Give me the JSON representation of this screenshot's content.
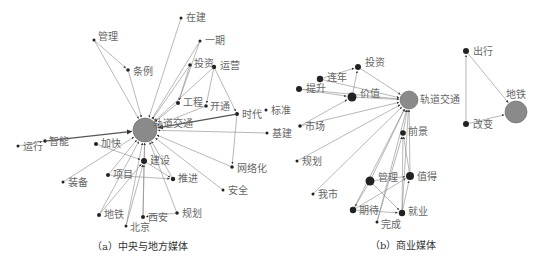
{
  "panels": [
    {
      "id": "a",
      "caption": "（a）中央与地方媒体",
      "hub": {
        "label": "轨道交通",
        "x": 145,
        "y": 130,
        "r": 12
      },
      "nodes": [
        {
          "label": "在建",
          "x": 181,
          "y": 18,
          "r": 1.5,
          "lx": 186,
          "ly": 21
        },
        {
          "label": "管理",
          "x": 94,
          "y": 40,
          "r": 1.5,
          "lx": 98,
          "ly": 40
        },
        {
          "label": "一期",
          "x": 200,
          "y": 41,
          "r": 1.5,
          "lx": 205,
          "ly": 44
        },
        {
          "label": "条例",
          "x": 128,
          "y": 70,
          "r": 1.8,
          "lx": 133,
          "ly": 75
        },
        {
          "label": "投资",
          "x": 190,
          "y": 65,
          "r": 1.8,
          "lx": 194,
          "ly": 67
        },
        {
          "label": "运营",
          "x": 214,
          "y": 67,
          "r": 2.2,
          "lx": 220,
          "ly": 69
        },
        {
          "label": "工程",
          "x": 178,
          "y": 103,
          "r": 2,
          "lx": 183,
          "ly": 106
        },
        {
          "label": "开通",
          "x": 206,
          "y": 106,
          "r": 1.8,
          "lx": 210,
          "ly": 110
        },
        {
          "label": "时代",
          "x": 237,
          "y": 114,
          "r": 2,
          "lx": 242,
          "ly": 118
        },
        {
          "label": "标准",
          "x": 266,
          "y": 110,
          "r": 1.5,
          "lx": 271,
          "ly": 114
        },
        {
          "label": "基建",
          "x": 267,
          "y": 133,
          "r": 1.5,
          "lx": 272,
          "ly": 137
        },
        {
          "label": "智能",
          "x": 45,
          "y": 141,
          "r": 1.8,
          "lx": 49,
          "ly": 145
        },
        {
          "label": "运行",
          "x": 18,
          "y": 146,
          "r": 1.5,
          "lx": 23,
          "ly": 150
        },
        {
          "label": "加快",
          "x": 96,
          "y": 144,
          "r": 2,
          "lx": 101,
          "ly": 147
        },
        {
          "label": "建设",
          "x": 144,
          "y": 161,
          "r": 3,
          "lx": 150,
          "ly": 164
        },
        {
          "label": "网络化",
          "x": 232,
          "y": 167,
          "r": 1.8,
          "lx": 237,
          "ly": 172
        },
        {
          "label": "项目",
          "x": 108,
          "y": 175,
          "r": 2,
          "lx": 113,
          "ly": 178
        },
        {
          "label": "推进",
          "x": 173,
          "y": 179,
          "r": 2.2,
          "lx": 178,
          "ly": 182
        },
        {
          "label": "装备",
          "x": 63,
          "y": 182,
          "r": 1.5,
          "lx": 68,
          "ly": 186
        },
        {
          "label": "安全",
          "x": 223,
          "y": 190,
          "r": 1.5,
          "lx": 228,
          "ly": 194
        },
        {
          "label": "地铁",
          "x": 99,
          "y": 215,
          "r": 2,
          "lx": 104,
          "ly": 218
        },
        {
          "label": "西安",
          "x": 143,
          "y": 217,
          "r": 2,
          "lx": 148,
          "ly": 221
        },
        {
          "label": "规划",
          "x": 177,
          "y": 213,
          "r": 1.8,
          "lx": 182,
          "ly": 217
        },
        {
          "label": "北京",
          "x": 126,
          "y": 226,
          "r": 1.5,
          "lx": 130,
          "ly": 231
        }
      ],
      "edges": [
        [
          "在建",
          "hub"
        ],
        [
          "管理",
          "hub"
        ],
        [
          "管理",
          "条例"
        ],
        [
          "一期",
          "hub"
        ],
        [
          "一期",
          "工程"
        ],
        [
          "条例",
          "hub"
        ],
        [
          "投资",
          "hub"
        ],
        [
          "投资",
          "工程"
        ],
        [
          "运营",
          "hub"
        ],
        [
          "运营",
          "开通"
        ],
        [
          "运营",
          "时代"
        ],
        [
          "工程",
          "hub"
        ],
        [
          "开通",
          "hub"
        ],
        [
          "时代",
          "hub",
          "thick"
        ],
        [
          "时代",
          "网络化"
        ],
        [
          "基建",
          "hub"
        ],
        [
          "智能",
          "hub",
          "thick"
        ],
        [
          "运行",
          "智能"
        ],
        [
          "加快",
          "建设"
        ],
        [
          "建设",
          "hub"
        ],
        [
          "建设",
          "推进"
        ],
        [
          "网络化",
          "hub"
        ],
        [
          "项目",
          "hub"
        ],
        [
          "项目",
          "推进"
        ],
        [
          "推进",
          "hub"
        ],
        [
          "装备",
          "hub"
        ],
        [
          "安全",
          "hub"
        ],
        [
          "地铁",
          "hub"
        ],
        [
          "地铁",
          "建设"
        ],
        [
          "西安",
          "hub"
        ],
        [
          "西安",
          "建设"
        ],
        [
          "规划",
          "hub"
        ],
        [
          "规划",
          "西安"
        ],
        [
          "北京",
          "hub"
        ],
        [
          "北京",
          "建设"
        ]
      ]
    },
    {
      "id": "b1",
      "caption": "（b）商业媒体",
      "hub": {
        "label": "轨道交通",
        "x": 409,
        "y": 100,
        "r": 9
      },
      "nodes": [
        {
          "label": "投资",
          "x": 358,
          "y": 67,
          "r": 3,
          "lx": 365,
          "ly": 66
        },
        {
          "label": "连年",
          "x": 320,
          "y": 79,
          "r": 3.2,
          "lx": 327,
          "ly": 81
        },
        {
          "label": "提升",
          "x": 299,
          "y": 89,
          "r": 3,
          "lx": 306,
          "ly": 92
        },
        {
          "label": "价值",
          "x": 352,
          "y": 97,
          "r": 4.5,
          "lx": 360,
          "ly": 97
        },
        {
          "label": "市场",
          "x": 300,
          "y": 126,
          "r": 1.8,
          "lx": 305,
          "ly": 130
        },
        {
          "label": "前景",
          "x": 403,
          "y": 133,
          "r": 2.8,
          "lx": 408,
          "ly": 135
        },
        {
          "label": "规划",
          "x": 297,
          "y": 161,
          "r": 1.5,
          "lx": 302,
          "ly": 165
        },
        {
          "label": "值得",
          "x": 410,
          "y": 176,
          "r": 4,
          "lx": 417,
          "ly": 180
        },
        {
          "label": "管理",
          "x": 370,
          "y": 181,
          "r": 4.5,
          "lx": 378,
          "ly": 181
        },
        {
          "label": "我市",
          "x": 313,
          "y": 194,
          "r": 1.5,
          "lx": 318,
          "ly": 198
        },
        {
          "label": "期待",
          "x": 353,
          "y": 210,
          "r": 3.2,
          "lx": 359,
          "ly": 214
        },
        {
          "label": "就业",
          "x": 402,
          "y": 213,
          "r": 3.2,
          "lx": 408,
          "ly": 215
        },
        {
          "label": "完成",
          "x": 377,
          "y": 222,
          "r": 1.5,
          "lx": 381,
          "ly": 228
        }
      ],
      "edges": [
        [
          "投资",
          "hub"
        ],
        [
          "连年",
          "投资"
        ],
        [
          "连年",
          "hub"
        ],
        [
          "提升",
          "hub"
        ],
        [
          "提升",
          "价值"
        ],
        [
          "价值",
          "投资"
        ],
        [
          "价值",
          "hub"
        ],
        [
          "市场",
          "hub"
        ],
        [
          "市场",
          "价值"
        ],
        [
          "前景",
          "hub"
        ],
        [
          "规划",
          "hub"
        ],
        [
          "值得",
          "hub"
        ],
        [
          "值得",
          "前景"
        ],
        [
          "管理",
          "hub"
        ],
        [
          "管理",
          "值得"
        ],
        [
          "管理",
          "就业"
        ],
        [
          "管理",
          "期待"
        ],
        [
          "我市",
          "hub"
        ],
        [
          "期待",
          "hub"
        ],
        [
          "期待",
          "值得"
        ],
        [
          "期待",
          "就业"
        ],
        [
          "就业",
          "hub"
        ],
        [
          "就业",
          "前景"
        ],
        [
          "就业",
          "值得"
        ],
        [
          "完成",
          "hub"
        ],
        [
          "完成",
          "前景"
        ]
      ]
    },
    {
      "id": "b2",
      "caption": "",
      "hub": {
        "label": "地铁",
        "x": 516,
        "y": 112,
        "r": 11
      },
      "nodes": [
        {
          "label": "出行",
          "x": 466,
          "y": 51,
          "r": 3,
          "lx": 473,
          "ly": 55
        },
        {
          "label": "改变",
          "x": 466,
          "y": 124,
          "r": 3,
          "lx": 473,
          "ly": 128
        }
      ],
      "edges": [
        [
          "出行",
          "hub"
        ],
        [
          "改变",
          "hub"
        ],
        [
          "改变",
          "出行"
        ]
      ]
    }
  ]
}
